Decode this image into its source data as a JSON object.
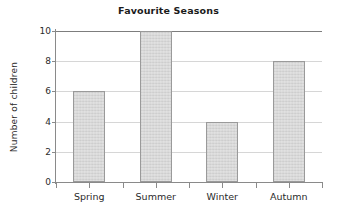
{
  "chart_data": {
    "type": "bar",
    "title": "Favourite Seasons",
    "xlabel": "",
    "ylabel": "Number of children",
    "categories": [
      "Spring",
      "Summer",
      "Winter",
      "Autumn"
    ],
    "values": [
      6,
      10,
      4,
      8
    ],
    "ylim": [
      0,
      10
    ],
    "yticks": [
      0,
      2,
      4,
      6,
      8,
      10
    ],
    "ytick_labels": [
      "0",
      "2",
      "4",
      "6",
      "8",
      "10"
    ],
    "grid": "horizontal",
    "legend": null,
    "colors": {
      "bar_fill": "#d6d6d6",
      "bar_border": "#9a9a9a",
      "gridline": "#d6d6d6",
      "axis": "#8a8a8a",
      "text": "#2b2b2b",
      "background": "#ffffff"
    }
  },
  "bars": [
    {
      "label": "Spring",
      "value": 6,
      "value_text": "6"
    },
    {
      "label": "Summer",
      "value": 10,
      "value_text": "10"
    },
    {
      "label": "Winter",
      "value": 4,
      "value_text": "4"
    },
    {
      "label": "Autumn",
      "value": 8,
      "value_text": "8"
    }
  ],
  "yticks": [
    {
      "label": "10"
    },
    {
      "label": "8"
    },
    {
      "label": "6"
    },
    {
      "label": "4"
    },
    {
      "label": "2"
    },
    {
      "label": "0"
    }
  ]
}
